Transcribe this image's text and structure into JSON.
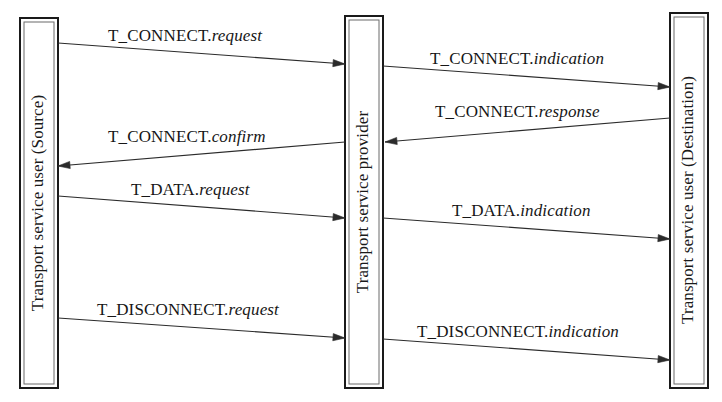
{
  "diagram": {
    "background_color": "#ffffff",
    "line_color": "#2b2b2b",
    "box_stroke_color": "#1a1a1a",
    "entities": [
      {
        "id": "source",
        "label": "Transport service user (Source)",
        "x": 20,
        "y": 18,
        "width": 38,
        "height": 370
      },
      {
        "id": "provider",
        "label": "Transport service provider",
        "x": 345,
        "y": 16,
        "width": 38,
        "height": 372
      },
      {
        "id": "destination",
        "label": "Transport service user (Destination)",
        "x": 670,
        "y": 13,
        "width": 38,
        "height": 375
      }
    ],
    "messages": [
      {
        "id": "t-connect-request",
        "primitive": "T_CONNECT.",
        "parameter": "request",
        "full_label": "T_CONNECT.request",
        "from": "source",
        "to": "provider",
        "direction": "right",
        "x1": 58,
        "y1": 43,
        "x2": 345,
        "y2": 64,
        "label_x": 108,
        "label_y": 27
      },
      {
        "id": "t-connect-indication",
        "primitive": "T_CONNECT.",
        "parameter": "indication",
        "full_label": "T_CONNECT.indication",
        "from": "provider",
        "to": "destination",
        "direction": "right",
        "x1": 383,
        "y1": 66,
        "x2": 670,
        "y2": 87,
        "label_x": 430,
        "label_y": 50
      },
      {
        "id": "t-connect-response",
        "primitive": "T_CONNECT.",
        "parameter": "response",
        "full_label": "T_CONNECT.response",
        "from": "destination",
        "to": "provider",
        "direction": "left",
        "x1": 670,
        "y1": 118,
        "x2": 385,
        "y2": 142,
        "label_x": 435,
        "label_y": 103
      },
      {
        "id": "t-connect-confirm",
        "primitive": "T_CONNECT.",
        "parameter": "confirm",
        "full_label": "T_CONNECT.confirm",
        "from": "provider",
        "to": "source",
        "direction": "left",
        "x1": 345,
        "y1": 142,
        "x2": 58,
        "y2": 166,
        "label_x": 108,
        "label_y": 128
      },
      {
        "id": "t-data-request",
        "primitive": "T_DATA.",
        "parameter": "request",
        "full_label": "T_DATA.request",
        "from": "source",
        "to": "provider",
        "direction": "right",
        "x1": 58,
        "y1": 196,
        "x2": 345,
        "y2": 218,
        "label_x": 131,
        "label_y": 181
      },
      {
        "id": "t-data-indication",
        "primitive": "T_DATA.",
        "parameter": "indication",
        "full_label": "T_DATA.indication",
        "from": "provider",
        "to": "destination",
        "direction": "right",
        "x1": 383,
        "y1": 218,
        "x2": 670,
        "y2": 239,
        "label_x": 452,
        "label_y": 202
      },
      {
        "id": "t-disconnect-request",
        "primitive": "T_DISCONNECT.",
        "parameter": "request",
        "full_label": "T_DISCONNECT.request",
        "from": "source",
        "to": "provider",
        "direction": "right",
        "x1": 58,
        "y1": 318,
        "x2": 345,
        "y2": 338,
        "label_x": 97,
        "label_y": 301
      },
      {
        "id": "t-disconnect-indication",
        "primitive": "T_DISCONNECT.",
        "parameter": "indication",
        "full_label": "T_DISCONNECT.indication",
        "from": "provider",
        "to": "destination",
        "direction": "right",
        "x1": 383,
        "y1": 339,
        "x2": 670,
        "y2": 360,
        "label_x": 417,
        "label_y": 323
      }
    ]
  }
}
